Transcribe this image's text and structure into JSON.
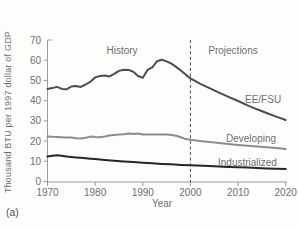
{
  "panel_label": "(a)",
  "chart_data": {
    "type": "line",
    "title": "",
    "xlabel": "Year",
    "ylabel": "Thousand BTU per 1997 dollar of GDP",
    "xlim": [
      1970,
      2020
    ],
    "ylim": [
      0,
      70
    ],
    "x_ticks": [
      1970,
      1980,
      1990,
      2000,
      2010,
      2020
    ],
    "y_ticks": [
      0,
      10,
      20,
      30,
      40,
      50,
      60,
      70
    ],
    "grid": false,
    "legend_position": "inline-right",
    "annotations": {
      "history": "History",
      "projections": "Projections",
      "divider_year": 2000,
      "divider_style": "dashed"
    },
    "series": [
      {
        "name": "EE/FSU",
        "color": "#4d4d4d",
        "points": [
          [
            1970,
            45.8
          ],
          [
            1971,
            46.2
          ],
          [
            1972,
            46.8
          ],
          [
            1973,
            45.8
          ],
          [
            1974,
            45.6
          ],
          [
            1975,
            47.0
          ],
          [
            1976,
            47.2
          ],
          [
            1977,
            46.8
          ],
          [
            1978,
            48.0
          ],
          [
            1979,
            49.3
          ],
          [
            1980,
            51.5
          ],
          [
            1981,
            52.2
          ],
          [
            1982,
            52.5
          ],
          [
            1983,
            52.0
          ],
          [
            1984,
            53.3
          ],
          [
            1985,
            54.7
          ],
          [
            1986,
            55.3
          ],
          [
            1987,
            55.2
          ],
          [
            1988,
            54.3
          ],
          [
            1989,
            52.2
          ],
          [
            1990,
            51.3
          ],
          [
            1991,
            55.2
          ],
          [
            1992,
            56.5
          ],
          [
            1993,
            59.5
          ],
          [
            1994,
            60.2
          ],
          [
            1995,
            59.4
          ],
          [
            1996,
            58.3
          ],
          [
            1997,
            56.7
          ],
          [
            1998,
            54.9
          ],
          [
            1999,
            52.9
          ],
          [
            2000,
            51.0
          ],
          [
            2002,
            48.4
          ],
          [
            2004,
            46.2
          ],
          [
            2006,
            44.0
          ],
          [
            2008,
            41.9
          ],
          [
            2010,
            39.8
          ],
          [
            2012,
            37.7
          ],
          [
            2014,
            35.7
          ],
          [
            2016,
            33.9
          ],
          [
            2018,
            32.1
          ],
          [
            2020,
            30.4
          ]
        ]
      },
      {
        "name": "Developing",
        "color": "#8c8c8c",
        "points": [
          [
            1970,
            22.3
          ],
          [
            1971,
            22.1
          ],
          [
            1972,
            22.0
          ],
          [
            1973,
            21.9
          ],
          [
            1974,
            21.8
          ],
          [
            1975,
            21.7
          ],
          [
            1976,
            21.4
          ],
          [
            1977,
            21.3
          ],
          [
            1978,
            21.6
          ],
          [
            1979,
            22.2
          ],
          [
            1980,
            22.0
          ],
          [
            1981,
            21.9
          ],
          [
            1982,
            22.2
          ],
          [
            1983,
            22.7
          ],
          [
            1984,
            23.0
          ],
          [
            1985,
            23.2
          ],
          [
            1986,
            23.4
          ],
          [
            1987,
            23.7
          ],
          [
            1988,
            23.5
          ],
          [
            1989,
            23.7
          ],
          [
            1990,
            23.2
          ],
          [
            1991,
            23.2
          ],
          [
            1992,
            23.3
          ],
          [
            1993,
            23.3
          ],
          [
            1994,
            23.3
          ],
          [
            1995,
            23.2
          ],
          [
            1996,
            23.0
          ],
          [
            1997,
            22.6
          ],
          [
            1998,
            21.9
          ],
          [
            1999,
            21.0
          ],
          [
            2000,
            20.7
          ],
          [
            2002,
            20.1
          ],
          [
            2004,
            19.6
          ],
          [
            2006,
            19.1
          ],
          [
            2008,
            18.6
          ],
          [
            2010,
            18.1
          ],
          [
            2012,
            17.7
          ],
          [
            2014,
            17.3
          ],
          [
            2016,
            16.9
          ],
          [
            2018,
            16.5
          ],
          [
            2020,
            16.1
          ]
        ]
      },
      {
        "name": "Industrialized",
        "color": "#262626",
        "points": [
          [
            1970,
            12.3
          ],
          [
            1971,
            12.7
          ],
          [
            1972,
            13.0
          ],
          [
            1973,
            12.7
          ],
          [
            1974,
            12.3
          ],
          [
            1975,
            12.1
          ],
          [
            1976,
            11.9
          ],
          [
            1977,
            11.7
          ],
          [
            1978,
            11.5
          ],
          [
            1979,
            11.3
          ],
          [
            1980,
            11.1
          ],
          [
            1982,
            10.7
          ],
          [
            1984,
            10.3
          ],
          [
            1986,
            9.9
          ],
          [
            1988,
            9.6
          ],
          [
            1990,
            9.3
          ],
          [
            1992,
            9.0
          ],
          [
            1994,
            8.7
          ],
          [
            1996,
            8.5
          ],
          [
            1998,
            8.2
          ],
          [
            2000,
            8.0
          ],
          [
            2004,
            7.6
          ],
          [
            2008,
            7.2
          ],
          [
            2012,
            6.9
          ],
          [
            2016,
            6.5
          ],
          [
            2020,
            6.2
          ]
        ]
      }
    ]
  }
}
